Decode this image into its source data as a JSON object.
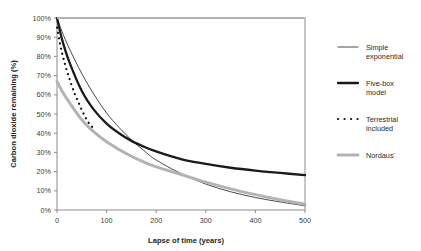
{
  "chart_data": {
    "type": "line",
    "title": "",
    "xlabel": "Lapse of time (years)",
    "ylabel": "Carbon dioxide remaining (%)",
    "xlim": [
      0,
      500
    ],
    "ylim": [
      0,
      100
    ],
    "grid": false,
    "legend_position": "right",
    "xticks": [
      "0",
      "100",
      "200",
      "300",
      "400",
      "500"
    ],
    "xtick_values": [
      0,
      100,
      200,
      300,
      400,
      500
    ],
    "yticks": [
      "0%",
      "10%",
      "20%",
      "30%",
      "40%",
      "50%",
      "60%",
      "70%",
      "80%",
      "90%",
      "100%"
    ],
    "ytick_values": [
      0,
      10,
      20,
      30,
      40,
      50,
      60,
      70,
      80,
      90,
      100
    ],
    "series": [
      {
        "name": "Simple exponential",
        "style": "thin-solid",
        "color": "#333333",
        "x": [
          0,
          10,
          25,
          50,
          75,
          100,
          125,
          150,
          175,
          200,
          250,
          300,
          350,
          400,
          450,
          500
        ],
        "values": [
          100,
          93,
          84,
          71,
          60,
          50.5,
          43,
          36.5,
          31,
          26,
          19,
          13.5,
          9.5,
          6.5,
          4.2,
          2.2
        ]
      },
      {
        "name": "Five-box model",
        "style": "thick-solid",
        "color": "#1a1a1a",
        "x": [
          0,
          10,
          25,
          50,
          75,
          100,
          125,
          150,
          175,
          200,
          250,
          300,
          350,
          400,
          450,
          500
        ],
        "values": [
          100,
          89,
          77,
          62,
          52,
          45,
          40,
          36,
          33,
          30.5,
          26.5,
          24,
          22,
          20.5,
          19.3,
          18.2
        ]
      },
      {
        "name": "Terrestrial included",
        "style": "dotted",
        "color": "#111111",
        "x": [
          0,
          5,
          10,
          15,
          20,
          25,
          30,
          35,
          40,
          45,
          50,
          55,
          60,
          65,
          70,
          75
        ],
        "values": [
          95,
          88,
          82,
          77,
          72.5,
          68.5,
          64.5,
          61,
          58,
          55,
          52,
          49.5,
          47,
          45,
          43.5,
          42
        ]
      },
      {
        "name": "Nordaus'",
        "style": "thick-gray",
        "color": "#b3b3b3",
        "x": [
          0,
          10,
          25,
          50,
          75,
          100,
          125,
          150,
          175,
          200,
          250,
          300,
          350,
          400,
          450,
          500
        ],
        "values": [
          67,
          62,
          56,
          47,
          40.5,
          35.5,
          31.5,
          28,
          25,
          22.5,
          18.5,
          14.5,
          11,
          8,
          5.3,
          3.0
        ]
      },
      {
        "name": "Nordaus' upper branch",
        "style": "thick-gray-top",
        "color": "#b3b3b3",
        "x": [
          0,
          500
        ],
        "values": [
          100,
          100
        ]
      }
    ]
  },
  "legend": {
    "items": [
      {
        "label_line1": "Simple",
        "label_line2": "exponential",
        "swatch": "thin-solid"
      },
      {
        "label_line1": "Five-box",
        "label_line2": "model",
        "swatch": "thick-solid"
      },
      {
        "label_line1": "Terrestrial",
        "label_line2": "included",
        "swatch": "dotted"
      },
      {
        "label_line1": "Nordaus'",
        "label_line2": "",
        "swatch": "thick-gray"
      }
    ]
  },
  "colors": {
    "frame": "#8c8c8c",
    "thin_line": "#333333",
    "thick_line": "#1a1a1a",
    "dotted_line": "#111111",
    "gray_line": "#b3b3b3",
    "background": "#ffffff"
  }
}
